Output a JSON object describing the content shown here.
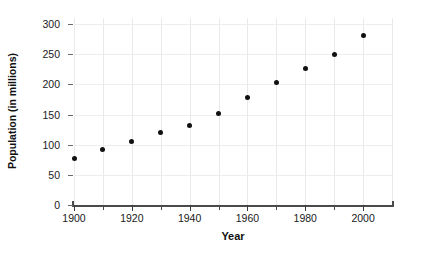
{
  "chart_data": {
    "type": "scatter",
    "title": "",
    "xlabel": "Year",
    "ylabel": "Population (in millions)",
    "x": [
      1900,
      1910,
      1920,
      1930,
      1940,
      1950,
      1960,
      1970,
      1980,
      1990,
      2000
    ],
    "values": [
      77,
      92,
      106,
      121,
      132,
      151,
      179,
      203,
      227,
      249,
      281
    ],
    "series": [
      {
        "name": "Population",
        "values": [
          77,
          92,
          106,
          121,
          132,
          151,
          179,
          203,
          227,
          249,
          281
        ]
      }
    ],
    "xlim": [
      1900,
      2010
    ],
    "ylim": [
      0,
      310
    ],
    "xticks": [
      1900,
      1920,
      1940,
      1960,
      1980,
      2000
    ],
    "xtick_labels": [
      "1900",
      "1920",
      "1940",
      "1960",
      "1980",
      "2000"
    ],
    "xminorticks": [
      1910,
      1930,
      1950,
      1970,
      1990
    ],
    "yticks": [
      0,
      50,
      100,
      150,
      200,
      250,
      300
    ],
    "ytick_labels": [
      "0",
      "50",
      "100",
      "150",
      "200",
      "250",
      "300"
    ],
    "grid": true,
    "grid_color": "#e9e9e9",
    "legend": null,
    "marker_color": "#111111",
    "axis_color": "#4a4a4a",
    "background": "#ffffff"
  }
}
